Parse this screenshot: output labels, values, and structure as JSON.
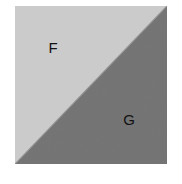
{
  "figure": {
    "name": "two-region-square-diagram",
    "canvas": {
      "width": 182,
      "height": 184,
      "background_color": "#ffffff"
    },
    "square": {
      "x": 15,
      "y": 6,
      "width": 152,
      "height": 158,
      "split": "diagonal-top-right-to-bottom-left"
    },
    "regions": [
      {
        "id": "region-f",
        "label": "F",
        "position": "upper-left-triangle",
        "fill_color": "#c9c9c9",
        "label_x": 53,
        "label_y": 49,
        "vertices": "top-left, top-right, bottom-left"
      },
      {
        "id": "region-g",
        "label": "G",
        "position": "lower-right-triangle",
        "fill_color": "#707070",
        "label_x": 129,
        "label_y": 121,
        "vertices": "top-right, bottom-right, bottom-left"
      }
    ],
    "diagonal": {
      "from": "top-right",
      "to": "bottom-left",
      "color": "#8e8e8e"
    },
    "texture": {
      "type": "subtle-noise",
      "opacity": 0.07
    }
  },
  "chart_data": {
    "type": "diagram",
    "title": "",
    "categories": [
      "F",
      "G"
    ],
    "values": [
      50,
      50
    ],
    "labels": [
      "F",
      "G"
    ],
    "colors": [
      "#c9c9c9",
      "#707070"
    ],
    "xlabel": "",
    "ylabel": ""
  }
}
